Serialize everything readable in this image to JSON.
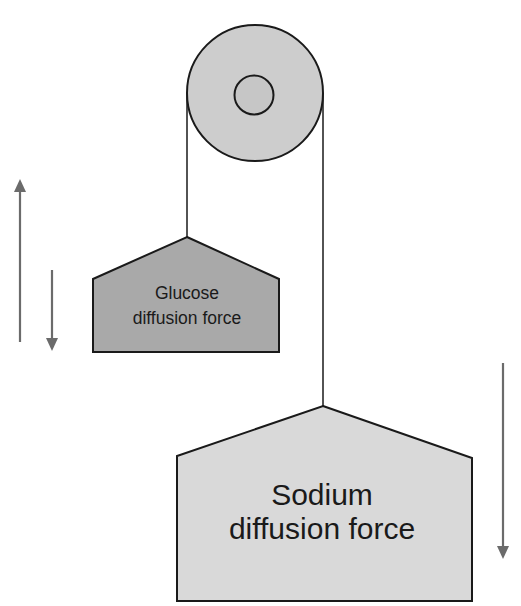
{
  "diagram": {
    "type": "pulley-analogy",
    "colors": {
      "pulley_fill": "#cdcdcd",
      "outline": "#1a1a1a",
      "glucose_fill": "#a9a9a9",
      "sodium_fill": "#d9d9d9",
      "arrow": "#6b6b6b"
    },
    "weights": {
      "glucose": {
        "line1": "Glucose",
        "line2": "diffusion force"
      },
      "sodium": {
        "line1": "Sodium",
        "line2": "diffusion force"
      }
    },
    "arrows": [
      {
        "name": "up-arrow-left",
        "direction": "up"
      },
      {
        "name": "down-arrow-left",
        "direction": "down"
      },
      {
        "name": "down-arrow-right",
        "direction": "down"
      }
    ]
  }
}
